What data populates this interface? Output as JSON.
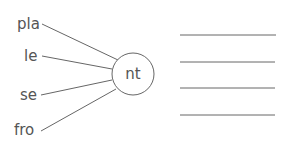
{
  "diagram": {
    "center_label": "nt",
    "prefixes": [
      {
        "label": "pla",
        "x": 17,
        "y": 29
      },
      {
        "label": "le",
        "x": 24,
        "y": 59
      },
      {
        "label": "se",
        "x": 20,
        "y": 100
      },
      {
        "label": "fro",
        "x": 14,
        "y": 135
      }
    ],
    "answer_lines": 4,
    "colors": {
      "stroke": "#555555",
      "text": "#555555"
    }
  }
}
